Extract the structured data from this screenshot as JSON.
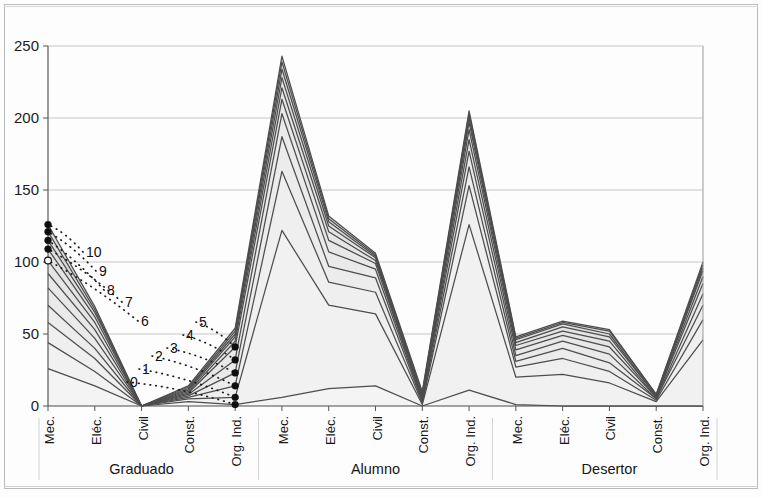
{
  "chart_data": {
    "type": "area",
    "title": "",
    "subtitle": "",
    "xlabel": "",
    "ylabel": "",
    "ylim": [
      0,
      250
    ],
    "yticks": [
      0,
      50,
      100,
      150,
      200,
      250
    ],
    "ytick_labels": [
      "0",
      "50",
      "100",
      "150",
      "200",
      "250"
    ],
    "grid": true,
    "legend_position": "inline-callouts",
    "stacked": true,
    "categories": [
      "Mec.",
      "Eléc.",
      "Civil",
      "Const.",
      "Org. Ind.",
      "Mec.",
      "Eléc.",
      "Civil",
      "Const.",
      "Org. Ind.",
      "Mec.",
      "Eléc.",
      "Civil",
      "Const.",
      "Org. Ind."
    ],
    "groups": [
      {
        "label": "Graduado",
        "span": 5
      },
      {
        "label": "Alumno",
        "span": 5
      },
      {
        "label": "Desertor",
        "span": 5
      }
    ],
    "series": [
      {
        "name": "0",
        "label": "0",
        "values": [
          26,
          14,
          0,
          3,
          1,
          6,
          12,
          14,
          0,
          11,
          1,
          0,
          0,
          0,
          0
        ]
      },
      {
        "name": "1",
        "label": "1",
        "values": [
          44,
          24,
          0,
          5,
          6,
          122,
          70,
          64,
          1,
          126,
          20,
          22,
          16,
          3,
          46
        ]
      },
      {
        "name": "2",
        "label": "2",
        "values": [
          58,
          33,
          0,
          6,
          14,
          163,
          86,
          79,
          2,
          153,
          27,
          33,
          24,
          4,
          60
        ]
      },
      {
        "name": "3",
        "label": "3",
        "values": [
          70,
          40,
          0,
          7,
          23,
          187,
          97,
          89,
          3,
          166,
          31,
          40,
          30,
          5,
          70
        ]
      },
      {
        "name": "4",
        "label": "4",
        "values": [
          82,
          47,
          0,
          8,
          32,
          203,
          107,
          95,
          4,
          177,
          35,
          45,
          36,
          5,
          78
        ]
      },
      {
        "name": "5",
        "label": "5",
        "values": [
          92,
          53,
          0,
          9,
          41,
          213,
          115,
          99,
          5,
          185,
          39,
          49,
          41,
          6,
          85
        ]
      },
      {
        "name": "6",
        "label": "6",
        "values": [
          101,
          58,
          0,
          10,
          45,
          221,
          121,
          101,
          6,
          192,
          42,
          52,
          45,
          6,
          90
        ]
      },
      {
        "name": "7",
        "label": "7",
        "values": [
          109,
          62,
          0,
          11,
          48,
          228,
          125,
          103,
          7,
          197,
          44,
          55,
          48,
          7,
          94
        ]
      },
      {
        "name": "8",
        "label": "8",
        "values": [
          115,
          65,
          0,
          12,
          50,
          234,
          128,
          104,
          8,
          200,
          46,
          57,
          50,
          7,
          96
        ]
      },
      {
        "name": "9",
        "label": "9",
        "values": [
          121,
          67,
          0,
          13,
          52,
          239,
          130,
          105,
          9,
          203,
          47,
          58,
          52,
          8,
          98
        ]
      },
      {
        "name": "10",
        "label": "10",
        "values": [
          126,
          69,
          0,
          14,
          54,
          243,
          132,
          106,
          10,
          205,
          48,
          59,
          53,
          8,
          100
        ]
      }
    ],
    "callouts": [
      {
        "label": "10",
        "note": "series 10"
      },
      {
        "label": "9",
        "note": "series 9"
      },
      {
        "label": "8",
        "note": "series 8"
      },
      {
        "label": "7",
        "note": "series 7"
      },
      {
        "label": "6",
        "note": "series 6"
      },
      {
        "label": "5",
        "note": "series 5"
      },
      {
        "label": "4",
        "note": "series 4"
      },
      {
        "label": "3",
        "note": "series 3"
      },
      {
        "label": "2",
        "note": "series 2"
      },
      {
        "label": "1",
        "note": "series 1"
      },
      {
        "label": "0",
        "note": "series 0"
      }
    ],
    "colors": {
      "fill_light": "#ededed",
      "fill_mid": "#dcdcdc",
      "line": "#4d4d4d",
      "line_dark": "#1f1f1f",
      "grid": "#c6c6c6",
      "axis": "#4a4a4a",
      "text": "#161616",
      "background": "#fdfdfd"
    }
  }
}
